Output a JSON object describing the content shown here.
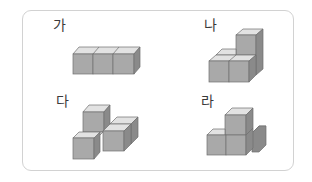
{
  "panels": [
    {
      "id": "ga",
      "label": "가",
      "cube_count": 3,
      "description": "three cubes in a single row"
    },
    {
      "id": "na",
      "label": "나",
      "cube_count": 5,
      "description": "staircase: front row of two, back row with column of two"
    },
    {
      "id": "da",
      "label": "다",
      "cube_count": 5,
      "description": "T/branched shape with one raised cube"
    },
    {
      "id": "ra",
      "label": "라",
      "cube_count": 4,
      "description": "base of three with one stacked cube on top"
    }
  ],
  "colors": {
    "frame_border": "#d2d2d2",
    "cube_front": "#a9a9a9",
    "cube_top": "#e2e2e2",
    "cube_side": "#8a8a8a",
    "cube_edge": "#6f6f6f",
    "label_text": "#3a3a3a"
  }
}
